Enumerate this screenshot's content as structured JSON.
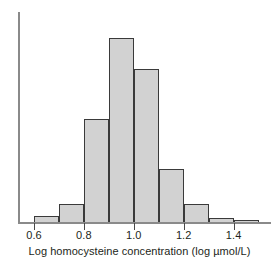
{
  "chart_data": {
    "type": "bar",
    "title": "",
    "subtitle": "",
    "xlabel": "Log homocysteine concentration (log µmol/L)",
    "ylabel": "",
    "xlim": [
      0.55,
      1.55
    ],
    "ylim": [
      0,
      100
    ],
    "grid": false,
    "legend": null,
    "bin_width": 0.1,
    "bin_edges": [
      0.6,
      0.7,
      0.8,
      0.9,
      1.0,
      1.1,
      1.2,
      1.3,
      1.4,
      1.5
    ],
    "categories": [
      "0.6-0.7",
      "0.7-0.8",
      "0.8-0.9",
      "0.9-1.0",
      "1.0-1.1",
      "1.1-1.2",
      "1.2-1.3",
      "1.3-1.4",
      "1.4-1.5"
    ],
    "values": [
      3,
      10,
      56,
      100,
      83,
      29,
      10,
      2,
      1
    ],
    "xticks": [
      0.6,
      0.8,
      1.0,
      1.2,
      1.4
    ],
    "xticklabels": [
      "0.6",
      "0.8",
      "1.0",
      "1.2",
      "1.4"
    ],
    "yticks": [],
    "yticklabels": [],
    "bar_fill_color": "#d2d2d2",
    "bar_edge_color": "#3a3a3a",
    "axis_color": "#8a8a8a"
  },
  "axes": {
    "x_label_text": "Log homocysteine concentration (log µmol/L)"
  }
}
